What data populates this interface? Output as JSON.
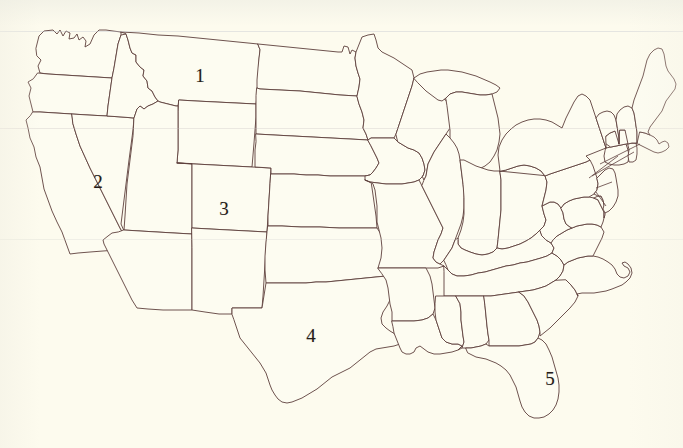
{
  "map": {
    "title": "United States Outline Map",
    "description": "Blank political outline map of the contiguous United States with five numbered states",
    "background_color": "#fdfbee",
    "outline_color": "#5d3f3c",
    "label_color": "#241b18",
    "width": 683,
    "height": 448
  },
  "labels": [
    {
      "id": "label-1",
      "text": "1",
      "x": 200,
      "y": 75,
      "state": "Montana"
    },
    {
      "id": "label-2",
      "text": "2",
      "x": 98,
      "y": 181,
      "state": "Nevada"
    },
    {
      "id": "label-3",
      "text": "3",
      "x": 224,
      "y": 208,
      "state": "Utah"
    },
    {
      "id": "label-4",
      "text": "4",
      "x": 311,
      "y": 335,
      "state": "Texas"
    },
    {
      "id": "label-5",
      "text": "5",
      "x": 550,
      "y": 378,
      "state": "Florida"
    }
  ]
}
